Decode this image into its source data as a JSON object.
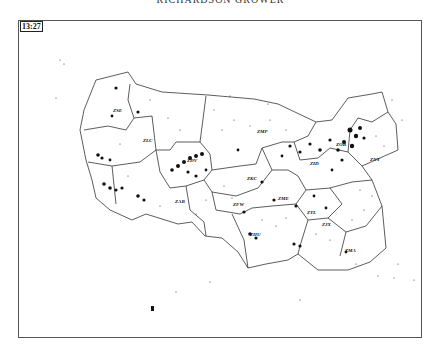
{
  "header": {
    "title": "RICHARDSON GROWER"
  },
  "display": {
    "time_label": "13:27",
    "frame": {
      "x": 18,
      "y": 20,
      "w": 404,
      "h": 318
    }
  },
  "map": {
    "type": "air-traffic sector map (continental US ARTCC centers)",
    "centers": [
      {
        "id": "ZSE",
        "label": "ZSE",
        "x": 113,
        "y": 112
      },
      {
        "id": "ZLC",
        "label": "ZLC",
        "x": 143,
        "y": 142
      },
      {
        "id": "ZDV",
        "label": "ZDV",
        "x": 187,
        "y": 162
      },
      {
        "id": "ZKC",
        "label": "ZKC",
        "x": 247,
        "y": 180
      },
      {
        "id": "ZMP",
        "label": "ZMP",
        "x": 257,
        "y": 133
      },
      {
        "id": "ZAB",
        "label": "ZAB",
        "x": 175,
        "y": 203
      },
      {
        "id": "ZFW",
        "label": "ZFW",
        "x": 233,
        "y": 206
      },
      {
        "id": "ZME",
        "label": "ZME",
        "x": 278,
        "y": 200
      },
      {
        "id": "ZHU",
        "label": "ZHU",
        "x": 250,
        "y": 236
      },
      {
        "id": "ZTL",
        "label": "ZTL",
        "x": 307,
        "y": 214
      },
      {
        "id": "ZID",
        "label": "ZID",
        "x": 310,
        "y": 165
      },
      {
        "id": "ZOB",
        "label": "ZOB",
        "x": 336,
        "y": 146
      },
      {
        "id": "ZNY",
        "label": "ZNY",
        "x": 370,
        "y": 161
      },
      {
        "id": "ZJX",
        "label": "ZJX",
        "x": 322,
        "y": 226
      },
      {
        "id": "ZMA",
        "label": "ZMA",
        "x": 345,
        "y": 252
      }
    ],
    "legend_marker": {
      "x": 151,
      "y": 306,
      "w": 3,
      "h": 5,
      "color": "#111111"
    }
  },
  "colors": {
    "ink": "#111111",
    "line": "#333333",
    "background": "#ffffff"
  }
}
